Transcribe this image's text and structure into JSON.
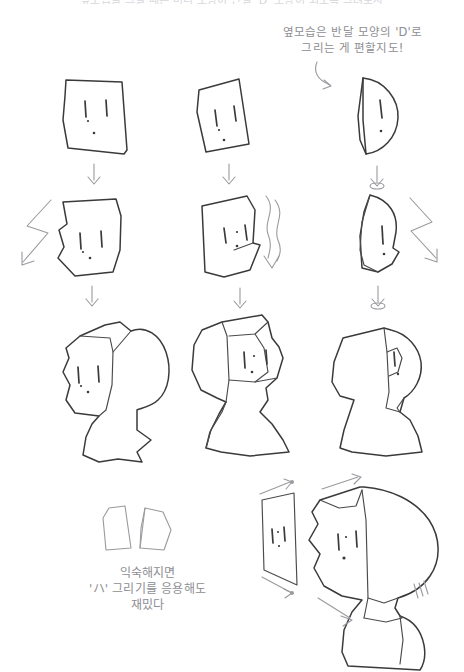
{
  "page": {
    "background_color": "#ffffff",
    "ink_color": "#3a3a3c",
    "caption_color": "#8e8e93",
    "width": 464,
    "height": 672
  },
  "captions": {
    "top_cutoff": "옆모습을 그릴 때는 머리 모양이 반달 'D' 모양이 되도록 그려보자",
    "d_hint": "옆모습은 반달 모양의 'D'로\n그리는 게 편할지도!",
    "ha_hint": "익숙해지면\n'ハ' 그리기를 응용해도\n재밌다"
  },
  "columns": [
    {
      "id": "front",
      "label": "정면",
      "steps": [
        {
          "step": 1,
          "shape": "rectangle",
          "description": "네모난 얼굴 기본형",
          "features": [
            "eye-left",
            "eye-right",
            "mouth-dot"
          ]
        },
        {
          "step": 2,
          "shape": "angular-face",
          "description": "턱 각을 깎은 얼굴형",
          "features": [
            "eye-left",
            "eye-right",
            "mouth-dot"
          ],
          "side_arrow": "zigzag-left"
        },
        {
          "step": 3,
          "shape": "head-with-hair",
          "description": "뒤통수와 목을 붙인 완성 머리",
          "features": [
            "eye-left",
            "eye-right",
            "mouth-dot"
          ]
        }
      ]
    },
    {
      "id": "three-quarter",
      "label": "반측면",
      "steps": [
        {
          "step": 1,
          "shape": "tilted-rectangle",
          "description": "기울인 네모",
          "features": [
            "eye-left",
            "eye-right",
            "mouth-dot"
          ]
        },
        {
          "step": 2,
          "shape": "tilted-angular-face",
          "description": "기울인 얼굴형",
          "features": [
            "eye-left",
            "eye-right",
            "mouth-dot"
          ],
          "side_arrow": "wavy-right"
        },
        {
          "step": 3,
          "shape": "three-quarter-head",
          "description": "반측면 완성 머리",
          "features": [
            "eye-left",
            "eye-right",
            "mouth-dot"
          ]
        }
      ]
    },
    {
      "id": "profile",
      "label": "옆모습",
      "steps": [
        {
          "step": 1,
          "shape": "half-moon-D",
          "description": "반달 'D' 모양",
          "features": [
            "eye-single",
            "mouth-dot"
          ]
        },
        {
          "step": 2,
          "shape": "pointed-profile",
          "description": "턱 끝을 뾰족하게",
          "features": [
            "eye-single",
            "mouth-dot"
          ],
          "side_arrow": "zigzag-right"
        },
        {
          "step": 3,
          "shape": "profile-head",
          "description": "옆모습 완성 머리",
          "features": [
            "eye-single",
            "mouth-dot"
          ]
        }
      ]
    }
  ],
  "bottom": {
    "ha_shapes": {
      "label": "'ハ' 모양 두 조각",
      "pieces": [
        "left-trapezoid",
        "right-trapezoid"
      ]
    },
    "demo": {
      "flat_panel": {
        "label": "평평한 면",
        "features": [
          "eye-left",
          "eye-right",
          "mouth-dot"
        ],
        "arrows": [
          "top-right-arrow",
          "bottom-right-arrow"
        ]
      },
      "final_head": {
        "label": "응용한 머리",
        "features": [
          "eye-left",
          "eye-right",
          "mouth-dot"
        ],
        "arrows": [
          "top-arrow",
          "chin-arrow"
        ]
      }
    }
  },
  "arrows": {
    "down_arrow_label": "다음 단계",
    "count_down_arrows": 6
  }
}
